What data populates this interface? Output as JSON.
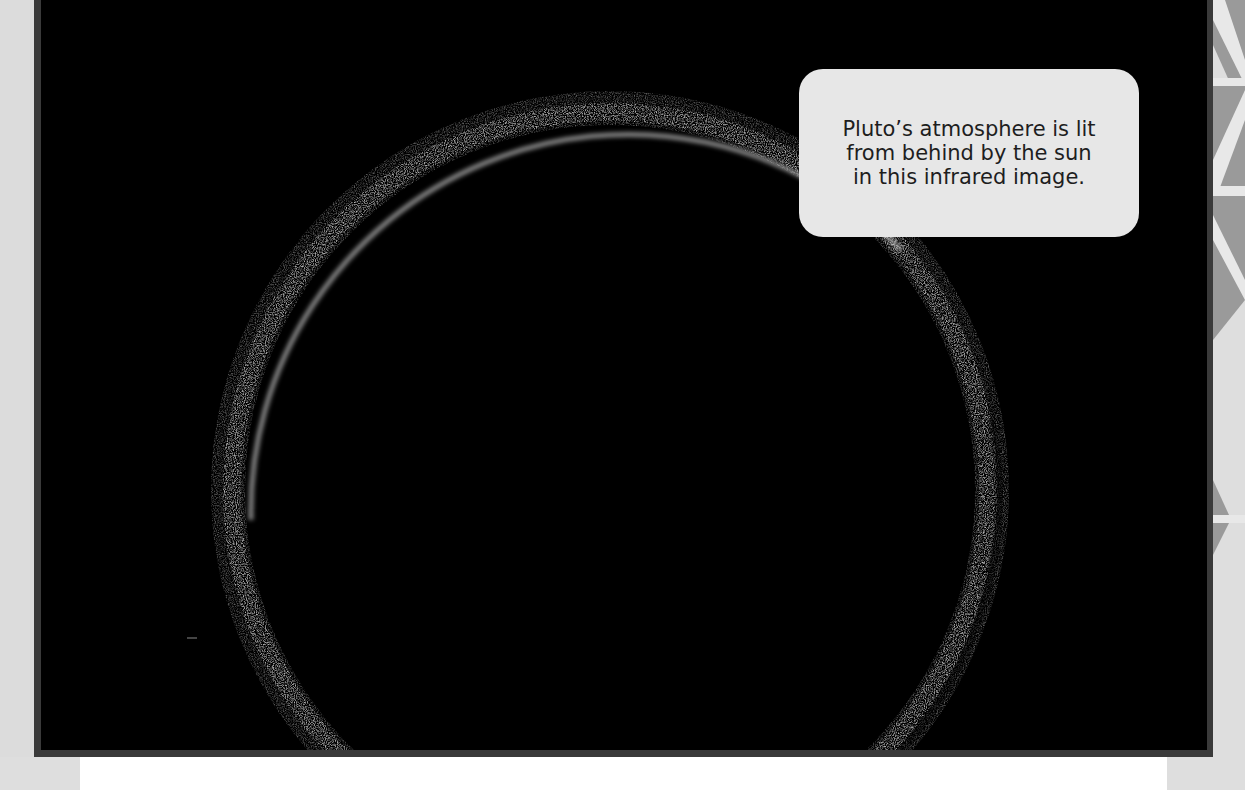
{
  "caption": {
    "lines": [
      "Pluto’s atmosphere is lit",
      "from behind by the sun",
      "in this infrared image."
    ]
  },
  "image": {
    "subject": "Pluto atmosphere backlit ring, infrared",
    "ring_color": "#d8d8d8",
    "background_color": "#000000",
    "frame_color": "#3a3a3a"
  },
  "decorations": {
    "right_strip_pattern": "chevron-triangles",
    "triangle_color": "#9a9a9a",
    "stripe_color": "#e8e8e8"
  }
}
